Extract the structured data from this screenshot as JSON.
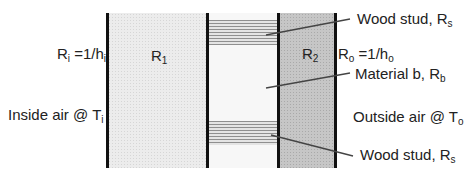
{
  "diagram": {
    "layers": [
      {
        "id": "R1",
        "label_main": "R",
        "label_sub": "1",
        "fill": "#ececec"
      },
      {
        "id": "middle",
        "description": "Material b with wood studs"
      },
      {
        "id": "R2",
        "label_main": "R",
        "label_sub": "2",
        "fill": "#c6c6c6"
      }
    ],
    "labels": {
      "ri": {
        "main": "R",
        "sub": "i",
        "rest": " =1/h",
        "rest_sub": "i"
      },
      "ro": {
        "main": "R",
        "sub": "o",
        "rest": " =1/h",
        "rest_sub": "o"
      },
      "inside_air": {
        "text": "Inside air @ T",
        "sub": "i"
      },
      "outside_air": {
        "text": "Outside air @ T",
        "sub": "o"
      },
      "wood_stud_top": {
        "text": "Wood stud, R",
        "sub": "s"
      },
      "material_b": {
        "text": "Material b, R",
        "sub": "b"
      },
      "wood_stud_bottom": {
        "text": "Wood stud, R",
        "sub": "s"
      }
    },
    "colors": {
      "wall_line": "#111111",
      "leader_line": "#444444"
    }
  }
}
